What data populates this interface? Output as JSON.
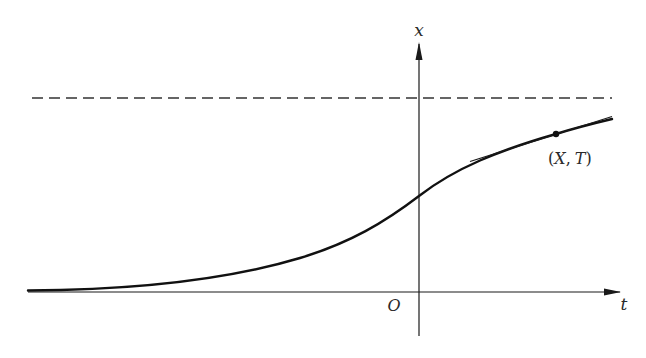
{
  "diagram": {
    "axes": {
      "horizontal_label": "t",
      "vertical_label": "x",
      "origin_label": "O"
    },
    "point": {
      "label": "(X, T)",
      "label_open": "(",
      "label_x": "X",
      "label_sep": ",",
      "label_t": "T",
      "label_close": ")"
    },
    "asymptote": {
      "style": "dashed"
    },
    "colors": {
      "stroke": "#1a1a1a",
      "dash": "#333333",
      "background": "#ffffff"
    }
  }
}
